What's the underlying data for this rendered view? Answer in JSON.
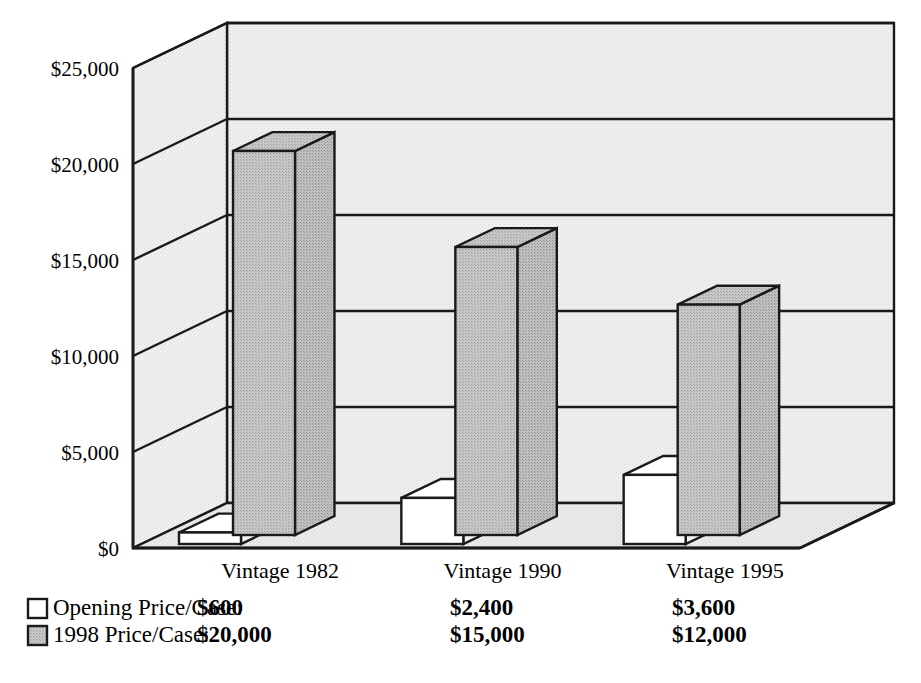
{
  "chart_data": {
    "type": "bar",
    "title": "",
    "xlabel": "",
    "ylabel": "",
    "categories": [
      "Vintage 1982",
      "Vintage 1990",
      "Vintage 1995"
    ],
    "series": [
      {
        "name": "Opening Price/Case:",
        "values": [
          600,
          2400,
          3600
        ],
        "value_labels": [
          "$600",
          "$2,400",
          "$3,600"
        ],
        "color": "#ffffff",
        "swatch": "white-swatch"
      },
      {
        "name": "1998 Price/Case:",
        "values": [
          20000,
          15000,
          12000
        ],
        "value_labels": [
          "$20,000",
          "$15,000",
          "$12,000"
        ],
        "color": "#b8b8b8",
        "swatch": "gray-swatch"
      }
    ],
    "ylim": [
      0,
      25000
    ],
    "ytick_values": [
      0,
      5000,
      10000,
      15000,
      20000,
      25000
    ],
    "ytick_labels": [
      "$0",
      "$5,000",
      "$10,000",
      "$15,000",
      "$20,000",
      "$25,000"
    ],
    "grid": true,
    "legend_position": "below",
    "style": "3d-perspective-bar"
  },
  "colors": {
    "bar_gray": "#b8b8b8",
    "bar_white": "#ffffff",
    "wall": "#ececec",
    "floor": "#e4e4e4",
    "outline": "#1a1a1a",
    "background": "#ffffff"
  },
  "legend": {
    "rows": [
      {
        "swatch": "white-swatch",
        "label": "Opening Price/Case:",
        "values": [
          "$600",
          "$2,400",
          "$3,600"
        ]
      },
      {
        "swatch": "gray-swatch",
        "label": "1998 Price/Case:",
        "values": [
          "$20,000",
          "$15,000",
          "$12,000"
        ]
      }
    ]
  }
}
